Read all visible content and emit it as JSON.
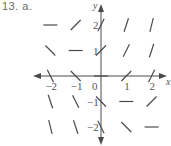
{
  "header": {
    "problem_label": "13. a."
  },
  "chart_data": {
    "type": "slope_field",
    "title": "",
    "xlabel": "x",
    "ylabel": "y",
    "xlim": [
      -2,
      2
    ],
    "ylim": [
      -2,
      2
    ],
    "grid": false,
    "x_ticks": [
      -2,
      -1,
      0,
      1,
      2
    ],
    "y_ticks": [
      -2,
      -1,
      1,
      2
    ],
    "x_tick_labels": [
      "−2",
      "−1",
      "0",
      "1",
      "2"
    ],
    "y_tick_labels": [
      "−2",
      "−1",
      "1",
      "2"
    ],
    "slopes_expression": "x + y",
    "points": [
      {
        "x": -2,
        "y": 2,
        "slope": 0
      },
      {
        "x": -1,
        "y": 2,
        "slope": 1
      },
      {
        "x": 0,
        "y": 2,
        "slope": 2
      },
      {
        "x": 1,
        "y": 2,
        "slope": 3
      },
      {
        "x": 2,
        "y": 2,
        "slope": 4
      },
      {
        "x": -2,
        "y": 1,
        "slope": -1
      },
      {
        "x": -1,
        "y": 1,
        "slope": 0
      },
      {
        "x": 0,
        "y": 1,
        "slope": 1
      },
      {
        "x": 1,
        "y": 1,
        "slope": 2
      },
      {
        "x": 2,
        "y": 1,
        "slope": 3
      },
      {
        "x": -2,
        "y": 0,
        "slope": -2
      },
      {
        "x": -1,
        "y": 0,
        "slope": -1
      },
      {
        "x": 0,
        "y": 0,
        "slope": 0
      },
      {
        "x": 1,
        "y": 0,
        "slope": 1
      },
      {
        "x": 2,
        "y": 0,
        "slope": 2
      },
      {
        "x": -2,
        "y": -1,
        "slope": -3
      },
      {
        "x": -1,
        "y": -1,
        "slope": -2
      },
      {
        "x": 0,
        "y": -1,
        "slope": -1
      },
      {
        "x": 1,
        "y": -1,
        "slope": 0
      },
      {
        "x": 2,
        "y": -1,
        "slope": 1
      },
      {
        "x": -2,
        "y": -2,
        "slope": -4
      },
      {
        "x": -1,
        "y": -2,
        "slope": -3
      },
      {
        "x": 0,
        "y": -2,
        "slope": -2
      },
      {
        "x": 1,
        "y": -2,
        "slope": -1
      },
      {
        "x": 2,
        "y": -2,
        "slope": 0
      }
    ],
    "colors": {
      "segment": "#4a4a4a",
      "axis": "#4a4a4a",
      "text": "#555555"
    }
  }
}
